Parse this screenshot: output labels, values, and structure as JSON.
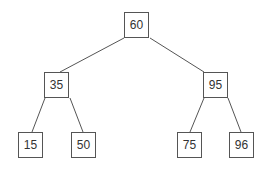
{
  "tree": {
    "nodes": [
      {
        "id": "n60",
        "label": "60",
        "x": 124,
        "y": 12
      },
      {
        "id": "n35",
        "label": "35",
        "x": 44,
        "y": 72
      },
      {
        "id": "n95",
        "label": "95",
        "x": 203,
        "y": 72
      },
      {
        "id": "n15",
        "label": "15",
        "x": 18,
        "y": 132
      },
      {
        "id": "n50",
        "label": "50",
        "x": 71,
        "y": 132
      },
      {
        "id": "n75",
        "label": "75",
        "x": 177,
        "y": 132
      },
      {
        "id": "n96",
        "label": "96",
        "x": 229,
        "y": 132
      }
    ],
    "edges": [
      {
        "from": "60",
        "to": "35"
      },
      {
        "from": "60",
        "to": "95"
      },
      {
        "from": "35",
        "to": "15"
      },
      {
        "from": "35",
        "to": "50"
      },
      {
        "from": "95",
        "to": "75"
      },
      {
        "from": "95",
        "to": "96"
      }
    ],
    "colors": {
      "line": "#555555",
      "border": "#555555",
      "text": "#333333"
    }
  }
}
